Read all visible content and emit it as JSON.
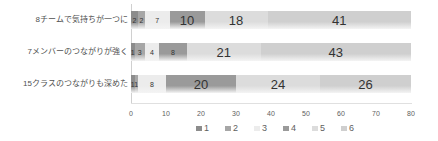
{
  "chart_data": {
    "type": "bar",
    "orientation": "horizontal",
    "stacked": true,
    "title": "",
    "xlabel": "",
    "ylabel": "",
    "xlim": [
      0,
      80
    ],
    "x_ticks": [
      0,
      10,
      20,
      30,
      40,
      50,
      60,
      70,
      80
    ],
    "categories": [
      "8チームで気持ちが一つに",
      "7メンバーのつながりが強く",
      "15クラスのつながりも深めた"
    ],
    "series": [
      {
        "name": "1",
        "values": [
          2,
          1,
          1
        ],
        "color": "#8c8c8c"
      },
      {
        "name": "2",
        "values": [
          2,
          3,
          1
        ],
        "color": "#a6a6a6"
      },
      {
        "name": "3",
        "values": [
          7,
          4,
          8
        ],
        "color": "#ececec"
      },
      {
        "name": "4",
        "values": [
          10,
          8,
          20
        ],
        "color": "#9a9a9a"
      },
      {
        "name": "5",
        "values": [
          18,
          21,
          24
        ],
        "color": "#dcdcdc"
      },
      {
        "name": "6",
        "values": [
          41,
          43,
          26
        ],
        "color": "#cfcfcf"
      }
    ],
    "legend_position": "bottom",
    "grid": false
  }
}
